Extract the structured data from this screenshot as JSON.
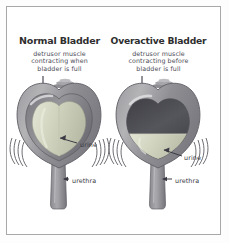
{
  "figure": {
    "colors": {
      "frame": "#a8a8a8",
      "background": "#ffffff",
      "heading_text": "#2e2e2e",
      "caption_text": "#4a4a55",
      "label_text": "#3a3a44",
      "muscle_outer": "#8f8f93",
      "muscle_mid": "#a6a6aa",
      "muscle_dark": "#6e6e74",
      "urine_fill": "#d9dcc8",
      "cavity_dark": "#4a4a50",
      "leader_line": "#3a3a44"
    }
  },
  "panels": [
    {
      "id": "normal",
      "title": "Normal Bladder",
      "caption_lines": [
        "detrusor muscle",
        "contracting when",
        "bladder is full"
      ],
      "labels": {
        "urine": "urine",
        "urethra": "urethra"
      },
      "state": "full",
      "icons": {
        "pointer": "pointer-line-icon",
        "dome": "dome-marker-icon",
        "contraction": "contraction-lines-icon"
      }
    },
    {
      "id": "overactive",
      "title": "Overactive Bladder",
      "caption_lines": [
        "detrusor muscle",
        "contracting before",
        "bladder is full"
      ],
      "labels": {
        "urine": "urine",
        "urethra": "urethra"
      },
      "state": "partially-full",
      "icons": {
        "pointer": "pointer-line-icon",
        "dome": "dome-marker-icon",
        "contraction": "contraction-lines-icon"
      }
    }
  ]
}
